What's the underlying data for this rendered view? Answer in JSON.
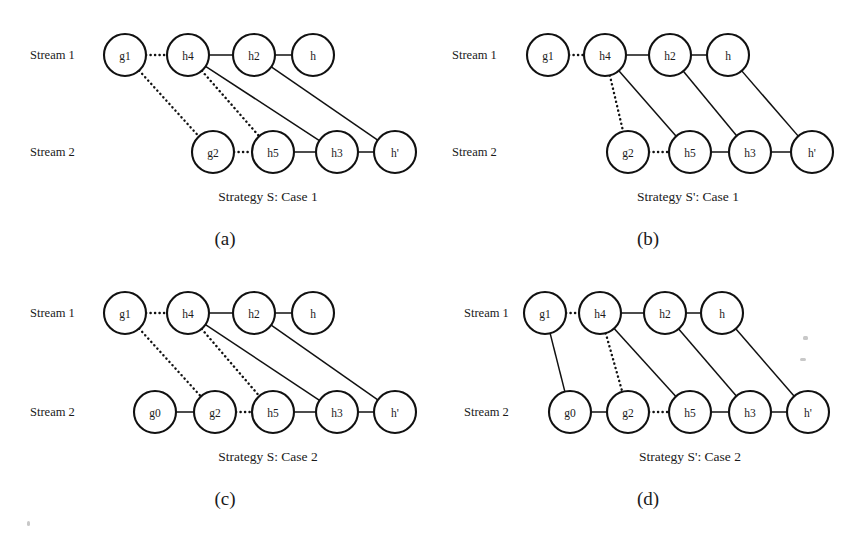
{
  "figure": {
    "background_color": "#ffffff",
    "ink_color": "#111111",
    "stream_labels": {
      "stream1": "Stream 1",
      "stream2": "Stream 2"
    }
  },
  "panels": [
    {
      "id": "panel-a",
      "letter": "(a)",
      "caption": "Strategy S: Case 1",
      "origin": {
        "x": 0,
        "y": 0
      },
      "stream1_label_pos": {
        "x": 30,
        "y": 55
      },
      "stream2_label_pos": {
        "x": 30,
        "y": 152
      },
      "caption_pos": {
        "x": 268,
        "y": 196
      },
      "letter_pos": {
        "x": 225,
        "y": 238
      },
      "nodes": [
        {
          "name": "g1",
          "label": "g1",
          "x": 125,
          "y": 55,
          "r": 21,
          "row": 1
        },
        {
          "name": "h4",
          "label": "h4",
          "x": 188,
          "y": 55,
          "r": 21,
          "row": 1
        },
        {
          "name": "h2",
          "label": "h2",
          "x": 254,
          "y": 55,
          "r": 21,
          "row": 1
        },
        {
          "name": "h",
          "label": "h",
          "x": 313,
          "y": 55,
          "r": 21,
          "row": 1
        },
        {
          "name": "g2",
          "label": "g2",
          "x": 213,
          "y": 152,
          "r": 21,
          "row": 2
        },
        {
          "name": "h5",
          "label": "h5",
          "x": 273,
          "y": 152,
          "r": 21,
          "row": 2
        },
        {
          "name": "h3",
          "label": "h3",
          "x": 337,
          "y": 152,
          "r": 21,
          "row": 2
        },
        {
          "name": "h'",
          "label": "h'",
          "x": 395,
          "y": 152,
          "r": 21,
          "row": 2
        }
      ],
      "edges": [
        {
          "from": "g1",
          "to": "h4",
          "style": "dotted"
        },
        {
          "from": "h4",
          "to": "h2",
          "style": "solid"
        },
        {
          "from": "h2",
          "to": "h",
          "style": "solid"
        },
        {
          "from": "g2",
          "to": "h5",
          "style": "dotted"
        },
        {
          "from": "h5",
          "to": "h3",
          "style": "solid"
        },
        {
          "from": "h3",
          "to": "h'",
          "style": "solid"
        },
        {
          "from": "g1",
          "to": "g2",
          "style": "dotted"
        },
        {
          "from": "h4",
          "to": "h5",
          "style": "dotted"
        },
        {
          "from": "h4",
          "to": "h3",
          "style": "solid"
        },
        {
          "from": "h2",
          "to": "h'",
          "style": "solid"
        }
      ]
    },
    {
      "id": "panel-b",
      "letter": "(b)",
      "caption": "Strategy S': Case 1",
      "origin": {
        "x": 0,
        "y": 0
      },
      "stream1_label_pos": {
        "x": 452,
        "y": 55
      },
      "stream2_label_pos": {
        "x": 452,
        "y": 152
      },
      "caption_pos": {
        "x": 688,
        "y": 196
      },
      "letter_pos": {
        "x": 648,
        "y": 238
      },
      "nodes": [
        {
          "name": "g1",
          "label": "g1",
          "x": 548,
          "y": 55,
          "r": 21,
          "row": 1
        },
        {
          "name": "h4",
          "label": "h4",
          "x": 605,
          "y": 55,
          "r": 21,
          "row": 1
        },
        {
          "name": "h2",
          "label": "h2",
          "x": 670,
          "y": 55,
          "r": 21,
          "row": 1
        },
        {
          "name": "h",
          "label": "h",
          "x": 728,
          "y": 55,
          "r": 21,
          "row": 1
        },
        {
          "name": "g2",
          "label": "g2",
          "x": 628,
          "y": 152,
          "r": 21,
          "row": 2
        },
        {
          "name": "h5",
          "label": "h5",
          "x": 690,
          "y": 152,
          "r": 21,
          "row": 2
        },
        {
          "name": "h3",
          "label": "h3",
          "x": 750,
          "y": 152,
          "r": 21,
          "row": 2
        },
        {
          "name": "h'",
          "label": "h'",
          "x": 812,
          "y": 152,
          "r": 21,
          "row": 2
        }
      ],
      "edges": [
        {
          "from": "g1",
          "to": "h4",
          "style": "dotted"
        },
        {
          "from": "h4",
          "to": "h2",
          "style": "solid"
        },
        {
          "from": "h2",
          "to": "h",
          "style": "solid"
        },
        {
          "from": "g2",
          "to": "h5",
          "style": "dotted"
        },
        {
          "from": "h5",
          "to": "h3",
          "style": "solid"
        },
        {
          "from": "h3",
          "to": "h'",
          "style": "solid"
        },
        {
          "from": "h4",
          "to": "g2",
          "style": "dotted"
        },
        {
          "from": "h4",
          "to": "h5",
          "style": "solid"
        },
        {
          "from": "h2",
          "to": "h3",
          "style": "solid"
        },
        {
          "from": "h",
          "to": "h'",
          "style": "solid"
        }
      ]
    },
    {
      "id": "panel-c",
      "letter": "(c)",
      "caption": "Strategy S: Case 2",
      "origin": {
        "x": 0,
        "y": 0
      },
      "stream1_label_pos": {
        "x": 30,
        "y": 313
      },
      "stream2_label_pos": {
        "x": 30,
        "y": 412
      },
      "caption_pos": {
        "x": 268,
        "y": 456
      },
      "letter_pos": {
        "x": 225,
        "y": 498
      },
      "nodes": [
        {
          "name": "g1",
          "label": "g1",
          "x": 125,
          "y": 313,
          "r": 21,
          "row": 1
        },
        {
          "name": "h4",
          "label": "h4",
          "x": 188,
          "y": 313,
          "r": 21,
          "row": 1
        },
        {
          "name": "h2",
          "label": "h2",
          "x": 254,
          "y": 313,
          "r": 21,
          "row": 1
        },
        {
          "name": "h",
          "label": "h",
          "x": 313,
          "y": 313,
          "r": 21,
          "row": 1
        },
        {
          "name": "g0",
          "label": "g0",
          "x": 155,
          "y": 412,
          "r": 21,
          "row": 2
        },
        {
          "name": "g2",
          "label": "g2",
          "x": 215,
          "y": 412,
          "r": 21,
          "row": 2
        },
        {
          "name": "h5",
          "label": "h5",
          "x": 273,
          "y": 412,
          "r": 21,
          "row": 2
        },
        {
          "name": "h3",
          "label": "h3",
          "x": 337,
          "y": 412,
          "r": 21,
          "row": 2
        },
        {
          "name": "h'",
          "label": "h'",
          "x": 395,
          "y": 412,
          "r": 21,
          "row": 2
        }
      ],
      "edges": [
        {
          "from": "g1",
          "to": "h4",
          "style": "dotted"
        },
        {
          "from": "h4",
          "to": "h2",
          "style": "solid"
        },
        {
          "from": "h2",
          "to": "h",
          "style": "solid"
        },
        {
          "from": "g0",
          "to": "g2",
          "style": "solid"
        },
        {
          "from": "g2",
          "to": "h5",
          "style": "dotted"
        },
        {
          "from": "h5",
          "to": "h3",
          "style": "solid"
        },
        {
          "from": "h3",
          "to": "h'",
          "style": "solid"
        },
        {
          "from": "g1",
          "to": "g2",
          "style": "dotted"
        },
        {
          "from": "h4",
          "to": "h5",
          "style": "dotted"
        },
        {
          "from": "h4",
          "to": "h3",
          "style": "solid"
        },
        {
          "from": "h2",
          "to": "h'",
          "style": "solid"
        }
      ]
    },
    {
      "id": "panel-d",
      "letter": "(d)",
      "caption": "Strategy S': Case 2",
      "origin": {
        "x": 0,
        "y": 0
      },
      "stream1_label_pos": {
        "x": 464,
        "y": 313
      },
      "stream2_label_pos": {
        "x": 464,
        "y": 412
      },
      "caption_pos": {
        "x": 690,
        "y": 456
      },
      "letter_pos": {
        "x": 648,
        "y": 498
      },
      "nodes": [
        {
          "name": "g1",
          "label": "g1",
          "x": 545,
          "y": 313,
          "r": 21,
          "row": 1
        },
        {
          "name": "h4",
          "label": "h4",
          "x": 600,
          "y": 313,
          "r": 21,
          "row": 1
        },
        {
          "name": "h2",
          "label": "h2",
          "x": 665,
          "y": 313,
          "r": 21,
          "row": 1
        },
        {
          "name": "h",
          "label": "h",
          "x": 722,
          "y": 313,
          "r": 21,
          "row": 1
        },
        {
          "name": "g0",
          "label": "g0",
          "x": 570,
          "y": 412,
          "r": 21,
          "row": 2
        },
        {
          "name": "g2",
          "label": "g2",
          "x": 628,
          "y": 412,
          "r": 21,
          "row": 2
        },
        {
          "name": "h5",
          "label": "h5",
          "x": 690,
          "y": 412,
          "r": 21,
          "row": 2
        },
        {
          "name": "h3",
          "label": "h3",
          "x": 750,
          "y": 412,
          "r": 21,
          "row": 2
        },
        {
          "name": "h'",
          "label": "h'",
          "x": 808,
          "y": 412,
          "r": 21,
          "row": 2
        }
      ],
      "edges": [
        {
          "from": "g1",
          "to": "h4",
          "style": "dotted"
        },
        {
          "from": "h4",
          "to": "h2",
          "style": "solid"
        },
        {
          "from": "h2",
          "to": "h",
          "style": "solid"
        },
        {
          "from": "g0",
          "to": "g2",
          "style": "solid"
        },
        {
          "from": "g2",
          "to": "h5",
          "style": "dotted"
        },
        {
          "from": "h5",
          "to": "h3",
          "style": "solid"
        },
        {
          "from": "h3",
          "to": "h'",
          "style": "solid"
        },
        {
          "from": "g1",
          "to": "g0",
          "style": "solid"
        },
        {
          "from": "h4",
          "to": "g2",
          "style": "dotted"
        },
        {
          "from": "h4",
          "to": "h5",
          "style": "solid"
        },
        {
          "from": "h2",
          "to": "h3",
          "style": "solid"
        },
        {
          "from": "h",
          "to": "h'",
          "style": "solid"
        }
      ]
    }
  ],
  "specks": [
    {
      "x": 803,
      "y": 336,
      "w": 5,
      "h": 4
    },
    {
      "x": 800,
      "y": 358,
      "w": 6,
      "h": 3
    },
    {
      "x": 27,
      "y": 521,
      "w": 3,
      "h": 5
    }
  ]
}
